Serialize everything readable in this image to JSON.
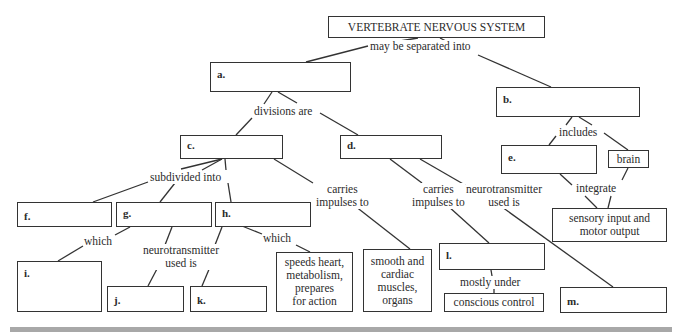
{
  "title": "VERTEBRATE NERVOUS SYSTEM",
  "connectors": {
    "root": "may be separated into",
    "a_divisions": "divisions are",
    "b_includes": "includes",
    "integrate": "integrate",
    "c_subdivided": "subdivided into",
    "c_carries_1": "carries",
    "c_carries_2": "impulses to",
    "d_carries_1": "carries",
    "d_carries_2": "impulses to",
    "d_neuro_1": "neurotransmitter",
    "d_neuro_2": "used is",
    "g_which": "which",
    "gh_neuro_1": "neurotransmitter",
    "gh_neuro_2": "used is",
    "h_which": "which",
    "l_mostly": "mostly under"
  },
  "boxes": {
    "a": "a.",
    "b": "b.",
    "c": "c.",
    "d": "d.",
    "e": "e.",
    "f": "f.",
    "g": "g.",
    "h": "h.",
    "i": "i.",
    "j": "j.",
    "k": "k.",
    "l": "l.",
    "m": "m.",
    "brain": "brain",
    "sensory_1": "sensory input and",
    "sensory_2": "motor output",
    "speeds_1": "speeds heart,",
    "speeds_2": "metabolism,",
    "speeds_3": "prepares",
    "speeds_4": "for action",
    "smooth_1": "smooth and",
    "smooth_2": "cardiac",
    "smooth_3": "muscles,",
    "smooth_4": "organs",
    "conscious": "conscious control"
  }
}
